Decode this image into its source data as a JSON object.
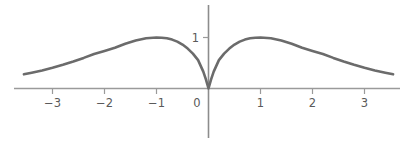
{
  "chart_data": {
    "type": "line",
    "title": "",
    "subtitle": "",
    "xlabel": "",
    "ylabel": "",
    "xlim": [
      -3.55,
      3.55
    ],
    "ylim": [
      -0.1,
      1.85
    ],
    "grid": false,
    "legend": null,
    "annotations": [],
    "x_ticks": [
      -3,
      -2,
      -1,
      1,
      2,
      3
    ],
    "x_tick_labels": [
      "−3",
      "−2",
      "−1",
      "1",
      "2",
      "3"
    ],
    "origin_label": "0",
    "y_ticks": [
      1
    ],
    "y_tick_labels": [
      "1"
    ],
    "series": [
      {
        "name": "f(x) = e·|x|·e^(-|x|)",
        "description": "Symmetric curve with a sharp cusp at the origin, maxima of height 1 at x = ±1, and slowly decaying tails.",
        "color": "#6b6b6b",
        "line_width": 2.6,
        "x": [
          -3.55,
          -3.4,
          -3.2,
          -3.0,
          -2.8,
          -2.6,
          -2.4,
          -2.2,
          -2.0,
          -1.8,
          -1.6,
          -1.4,
          -1.2,
          -1.0,
          -0.9,
          -0.8,
          -0.7,
          -0.6,
          -0.5,
          -0.4,
          -0.3,
          -0.2,
          -0.1,
          -0.05,
          0.0,
          0.05,
          0.1,
          0.2,
          0.3,
          0.4,
          0.5,
          0.6,
          0.7,
          0.8,
          0.9,
          1.0,
          1.2,
          1.4,
          1.6,
          1.8,
          2.0,
          2.2,
          2.4,
          2.6,
          2.8,
          3.0,
          3.2,
          3.4,
          3.55
        ],
        "y": [
          0.278,
          0.31,
          0.354,
          0.406,
          0.464,
          0.529,
          0.6,
          0.678,
          0.736,
          0.799,
          0.878,
          0.942,
          0.985,
          1.0,
          0.996,
          0.984,
          0.959,
          0.919,
          0.861,
          0.783,
          0.683,
          0.556,
          0.331,
          0.178,
          0.0,
          0.178,
          0.331,
          0.556,
          0.683,
          0.783,
          0.861,
          0.919,
          0.959,
          0.984,
          0.996,
          1.0,
          0.985,
          0.942,
          0.878,
          0.799,
          0.736,
          0.678,
          0.6,
          0.529,
          0.464,
          0.406,
          0.354,
          0.31,
          0.278
        ]
      }
    ]
  },
  "axes": {
    "x_axis_color": "#9a9a9a",
    "y_axis_color": "#8c8c8c",
    "tick_color": "#9a9a9a",
    "label_color": "#5a5a5a",
    "background": "#ffffff"
  }
}
